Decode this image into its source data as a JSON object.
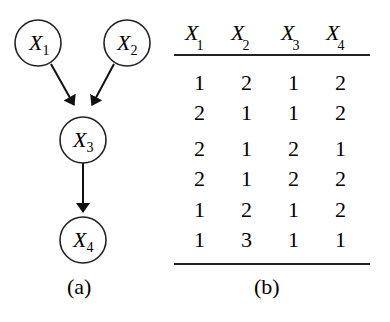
{
  "graph": {
    "nodes": [
      {
        "id": "X1",
        "label": "X",
        "sub": "1"
      },
      {
        "id": "X2",
        "label": "X",
        "sub": "2"
      },
      {
        "id": "X3",
        "label": "X",
        "sub": "3"
      },
      {
        "id": "X4",
        "label": "X",
        "sub": "4"
      }
    ],
    "edges": [
      {
        "from": "X1",
        "to": "X3"
      },
      {
        "from": "X2",
        "to": "X3"
      },
      {
        "from": "X3",
        "to": "X4"
      }
    ],
    "caption": "(a)"
  },
  "table": {
    "headers": [
      {
        "label": "X",
        "sub": "1"
      },
      {
        "label": "X",
        "sub": "2"
      },
      {
        "label": "X",
        "sub": "3"
      },
      {
        "label": "X",
        "sub": "4"
      }
    ],
    "rows": [
      [
        "1",
        "2",
        "1",
        "2"
      ],
      [
        "2",
        "1",
        "1",
        "2"
      ],
      [
        "2",
        "1",
        "2",
        "1"
      ],
      [
        "2",
        "1",
        "2",
        "2"
      ],
      [
        "1",
        "2",
        "1",
        "2"
      ],
      [
        "1",
        "3",
        "1",
        "1"
      ]
    ],
    "caption": "(b)"
  }
}
